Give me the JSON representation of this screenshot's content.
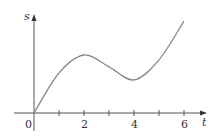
{
  "chart_data": {
    "type": "line",
    "title": "",
    "xlabel": "t",
    "ylabel": "s",
    "x": [
      0,
      1,
      2,
      3,
      4,
      5,
      6
    ],
    "series": [
      {
        "name": "s(t)",
        "values": [
          0,
          13.8,
          20,
          15.9,
          11.4,
          18.3,
          31.7
        ]
      }
    ],
    "x_ticks": [
      1,
      2,
      3,
      4,
      5,
      6
    ],
    "x_tick_labels": [
      "0",
      "2",
      "4",
      "6"
    ],
    "xlim": [
      0,
      6.8
    ],
    "ylim": [
      0,
      34
    ],
    "grid": false,
    "legend": "none",
    "annotations": [
      "local max near t=2",
      "local min near t=4"
    ]
  },
  "labels": {
    "origin": "0",
    "tick_2": "2",
    "tick_4": "4",
    "tick_6": "6",
    "x_axis": "t",
    "y_axis": "s"
  },
  "colors": {
    "curve": "#8a8a8a",
    "axis": "#555555"
  }
}
